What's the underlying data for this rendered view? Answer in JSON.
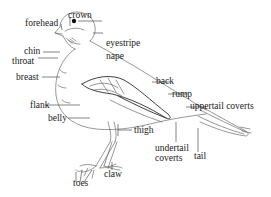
{
  "diagram": {
    "labels": {
      "forehead": "forehead",
      "crown": "crown",
      "eyestripe": "eyestripe",
      "nape": "nape",
      "chin": "chin",
      "throat": "throat",
      "breast": "breast",
      "back": "back",
      "rump": "rump",
      "uppertail_coverts": "uppertail coverts",
      "flank": "flank",
      "belly": "belly",
      "thigh": "thigh",
      "undertail_coverts_line1": "undertail",
      "undertail_coverts_line2": "coverts",
      "tail": "tail",
      "toes": "toes",
      "claw": "claw"
    },
    "colors": {
      "text": "#1a1a1a",
      "drawing": "#6b6b6b",
      "background": "#ffffff"
    }
  }
}
